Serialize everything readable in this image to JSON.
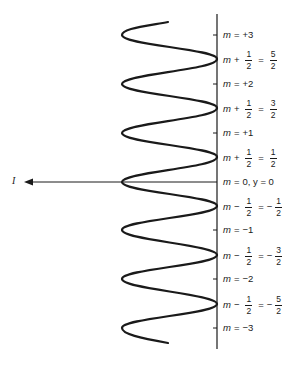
{
  "diagram": {
    "intensity_label": "I",
    "axis_labels_integer": [
      {
        "m": "m",
        "eq": "=",
        "val": "+3"
      },
      {
        "m": "m",
        "eq": "=",
        "val": "+2"
      },
      {
        "m": "m",
        "eq": "=",
        "val": "+1"
      },
      {
        "m": "m",
        "eq": "=",
        "val": "0, y = 0"
      },
      {
        "m": "m",
        "eq": "=",
        "val": "−1"
      },
      {
        "m": "m",
        "eq": "=",
        "val": "−2"
      },
      {
        "m": "m",
        "eq": "=",
        "val": "−3"
      }
    ],
    "axis_labels_half": [
      {
        "m": "m",
        "op": "+",
        "num": "1",
        "den": "2",
        "eq": "=",
        "sign": "",
        "rnum": "5",
        "rden": "2"
      },
      {
        "m": "m",
        "op": "+",
        "num": "1",
        "den": "2",
        "eq": "=",
        "sign": "",
        "rnum": "3",
        "rden": "2"
      },
      {
        "m": "m",
        "op": "+",
        "num": "1",
        "den": "2",
        "eq": "=",
        "sign": "",
        "rnum": "1",
        "rden": "2"
      },
      {
        "m": "m",
        "op": "−",
        "num": "1",
        "den": "2",
        "eq": "=",
        "sign": "−",
        "rnum": "1",
        "rden": "2"
      },
      {
        "m": "m",
        "op": "−",
        "num": "1",
        "den": "2",
        "eq": "=",
        "sign": "−",
        "rnum": "3",
        "rden": "2"
      },
      {
        "m": "m",
        "op": "−",
        "num": "1",
        "den": "2",
        "eq": "=",
        "sign": "−",
        "rnum": "5",
        "rden": "2"
      }
    ],
    "colors": {
      "line": "#1a1a1a",
      "background": "#ffffff"
    }
  }
}
